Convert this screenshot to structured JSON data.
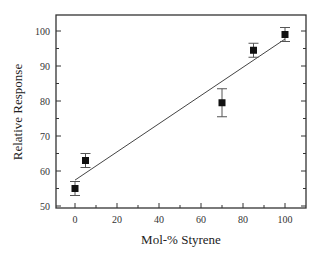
{
  "chart_data": {
    "type": "scatter",
    "title": "",
    "xlabel": "Mol-% Styrene",
    "ylabel": "Relative Response",
    "xlim": [
      -9,
      111
    ],
    "ylim": [
      50,
      105
    ],
    "x_ticks": [
      0,
      20,
      40,
      60,
      80,
      100
    ],
    "y_ticks": [
      50,
      60,
      70,
      80,
      90,
      100
    ],
    "grid": false,
    "legend": null,
    "series": [
      {
        "name": "Measured",
        "marker": "square",
        "x": [
          0,
          5,
          70,
          85,
          100
        ],
        "y": [
          55,
          63,
          79.5,
          94.5,
          99
        ],
        "error": [
          2,
          2,
          4,
          2,
          2
        ]
      }
    ],
    "fit_line": {
      "name": "Linear fit",
      "x": [
        0,
        100
      ],
      "y": [
        57.4,
        97.7
      ]
    }
  },
  "colors": {
    "axis": "#333333",
    "marker": "#111111",
    "line": "#444444",
    "errorbar": "#555555"
  }
}
